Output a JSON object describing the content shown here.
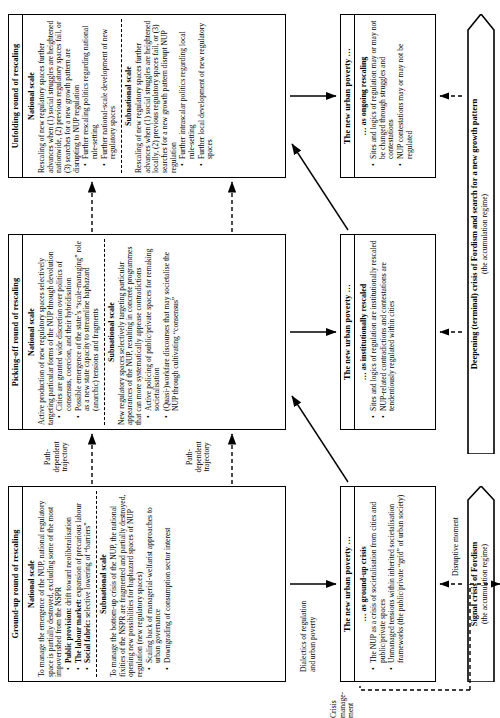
{
  "figure": {
    "orientation": "rotated-90-ccw",
    "columns": [
      {
        "id": "ground-up",
        "header": "Ground-up round of rescaling",
        "sections": [
          {
            "title": "National scale",
            "paragraph": "To manage the emergence of the NUP, national regulatory space is partially destroyed, excluding some of the most impoverished from the NSPR",
            "bullets": [
              {
                "lead": "Public provision:",
                "text": "drift toward neoliberalisation"
              },
              {
                "lead": "The labour market:",
                "text": "expansion of precarious labour"
              },
              {
                "lead": "Social fabric:",
                "text": "selective lowering of “barriers”"
              }
            ]
          },
          {
            "title": "Subnational scale",
            "paragraph": "To manage the bottom-up crisis of the NUP, the national fixities of the NSPR are fragmented and partially destroyed, opening new possibilities for haphazard spaces of NUP regulation (new regulatory spaces)",
            "bullets": [
              {
                "lead": "",
                "text": "Scaling back of managerial-welfarist approaches to urban governance"
              },
              {
                "lead": "",
                "text": "Downgrading of consumption sector interest"
              }
            ]
          }
        ]
      },
      {
        "id": "picking-off",
        "header": "Picking-off round of rescaling",
        "sections": [
          {
            "title": "National scale",
            "paragraph": "Active production of new regulatory spaces selectively targeting particular forms of the NUP through devolution",
            "bullets": [
              {
                "lead": "",
                "text": "Cities are granted wide discretion over politics of consensus, coercion, and their hybridisation"
              },
              {
                "lead": "",
                "text": "Possible emergence of the state’s “scale-managing” role as a new state capacity to streamline haphazard (anarchic) tensions and fragments"
              }
            ]
          },
          {
            "title": "Subnational scale",
            "paragraph": "New regulatory spaces selectively targeting particular appearances of the NUP, resulting in concrete programmes that can more systematically appease contradictions",
            "bullets": [
              {
                "lead": "",
                "text": "Active policing of public/private spaces for remaking societalisation"
              },
              {
                "lead": "",
                "text": "(Quasi-)workfare discourses that may societalise the NUP through cultivating “consensus”"
              }
            ]
          }
        ]
      },
      {
        "id": "unfolding",
        "header": "Unfolding round of rescaling",
        "sections": [
          {
            "title": "National scale",
            "paragraph": "Rescaling of new regulatory spaces further advances when (1) social struggles are heightened nationwide, (2) previous regulatory spaces fail, or (3) searches for a new growth pattern are disrupting to NUP regulation",
            "bullets": [
              {
                "lead": "",
                "text": "Further rescaling politics regarding national rule-setting"
              },
              {
                "lead": "",
                "text": "Further national-scale development of new regulatory spaces"
              }
            ]
          },
          {
            "title": "Subnational scale",
            "paragraph": "Rescaling of new regulatory spaces further advances when (1) social struggles are heightened locally, (2) previous regulatory spaces fail, or (3) searches for a new growth pattern disrupt NUP regulation",
            "bullets": [
              {
                "lead": "",
                "text": "Further intrascalar politics regarding local rule-setting"
              },
              {
                "lead": "",
                "text": "Further local development of new regulatory spaces"
              }
            ]
          }
        ]
      }
    ],
    "poverty_boxes": [
      {
        "id": "ground-up-crisis",
        "header": "The new urban poverty …",
        "subtitle": "… as ground-up crisis",
        "bullets": [
          "The NUP as a crisis of societalisation from cities and public/private spaces",
          "Unmanaged tensions within inherited societalisation frameworks (the public/private “grid” of urban society)"
        ]
      },
      {
        "id": "institutionally-rescaled",
        "header": "The new urban poverty …",
        "subtitle": "… as institutionally rescaled",
        "bullets": [
          "Sites and logics of regulation are institutionally rescaled",
          "NUP-related contradictions and contestations are tendentiously regulated within cities"
        ]
      },
      {
        "id": "ongoing-rescaling",
        "header": "The new urban poverty …",
        "subtitle": "… as ongoing rescaling",
        "bullets": [
          "Sites and logics of regulation may or may not be changed through struggles and contestations",
          "NUP contestations may or may not be regulated"
        ]
      }
    ],
    "connector_labels": [
      {
        "id": "path-dependent-1",
        "text": "Path-\ndependent\ntrajectory"
      },
      {
        "id": "path-dependent-2",
        "text": "Path-\ndependent\ntrajectory"
      },
      {
        "id": "dialectics",
        "text": "Dialectics of regulation\nand urban poverty"
      },
      {
        "id": "crisis-management",
        "text": "Crisis\nmanage-\nment"
      },
      {
        "id": "disruptive-moment",
        "text": "Disruptive moment"
      }
    ],
    "banners": [
      {
        "id": "signal-crisis",
        "title": "Signal crisis of Fordism",
        "subtitle": "(the accumulation regime)"
      },
      {
        "id": "deepening-crisis",
        "title": "Deepening (terminal) crisis of Fordism and search for a new growth pattern",
        "subtitle": "(the accumulation regime)"
      }
    ]
  }
}
